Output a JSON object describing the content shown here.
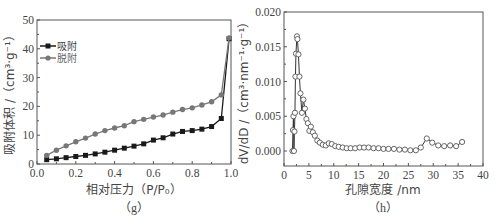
{
  "chart_data": [
    {
      "id": "g",
      "type": "line",
      "caption": "（g）",
      "title": "",
      "xlabel": "相对压力（P/P₀）",
      "ylabel": "吸附体积 /（cm³·g⁻¹）",
      "xlim": [
        0.0,
        1.0
      ],
      "ylim": [
        0,
        50
      ],
      "xticks": [
        "0.0",
        "0.2",
        "0.4",
        "0.6",
        "0.8",
        "1.0"
      ],
      "yticks": [
        "0",
        "10",
        "20",
        "30",
        "40",
        "50"
      ],
      "grid": false,
      "legend_position": "upper-left",
      "x": [
        0.05,
        0.1,
        0.15,
        0.2,
        0.25,
        0.3,
        0.35,
        0.4,
        0.45,
        0.5,
        0.55,
        0.6,
        0.65,
        0.7,
        0.75,
        0.8,
        0.85,
        0.9,
        0.95,
        0.99
      ],
      "series": [
        {
          "name": "吸附",
          "color": "#1a1a1a",
          "marker": "square",
          "values": [
            1.5,
            1.8,
            2.2,
            2.6,
            3.0,
            3.5,
            4.1,
            4.8,
            5.5,
            6.2,
            7.0,
            8.3,
            9.1,
            10.4,
            11.3,
            11.6,
            12.1,
            13.0,
            15.8,
            43.5
          ]
        },
        {
          "name": "脱附",
          "color": "#777777",
          "marker": "circle",
          "values": [
            3.0,
            4.8,
            6.3,
            7.7,
            9.0,
            10.4,
            11.6,
            12.5,
            13.3,
            14.7,
            15.5,
            16.3,
            17.0,
            18.0,
            18.9,
            19.5,
            20.5,
            21.6,
            24.0,
            43.8
          ]
        }
      ]
    },
    {
      "id": "h",
      "type": "line",
      "caption": "（h）",
      "title": "",
      "xlabel": "孔隙宽度 /nm",
      "ylabel": "dV/dD /（cm³·nm⁻¹·g⁻¹）",
      "xlim": [
        0,
        40
      ],
      "ylim": [
        0.0,
        0.02
      ],
      "xticks": [
        "0",
        "5",
        "10",
        "15",
        "20",
        "25",
        "30",
        "35",
        "40"
      ],
      "yticks": [
        "0.000",
        "0.005",
        "0.010",
        "0.015",
        "0.020"
      ],
      "grid": false,
      "series": [
        {
          "name": "dV/dD",
          "color": "#333333",
          "marker": "open-circle",
          "x": [
            1.7,
            1.8,
            1.9,
            2.0,
            2.1,
            2.2,
            2.3,
            2.4,
            2.6,
            2.7,
            2.9,
            3.1,
            3.3,
            3.6,
            3.9,
            4.2,
            4.5,
            4.8,
            5.1,
            5.4,
            5.8,
            6.2,
            6.7,
            7.2,
            7.8,
            8.4,
            9.0,
            9.6,
            10.3,
            11.0,
            11.8,
            12.6,
            13.4,
            14.3,
            15.2,
            16.1,
            17.0,
            18.0,
            19.0,
            20.0,
            21.0,
            22.1,
            23.2,
            24.3,
            25.4,
            26.5,
            27.5,
            28.7,
            29.8,
            31.0,
            32.2,
            33.4,
            34.6,
            35.8
          ],
          "values": [
            0.0,
            0.003,
            0.005,
            0.0,
            0.0028,
            0.0055,
            0.0107,
            0.014,
            0.0165,
            0.0161,
            0.0139,
            0.0107,
            0.0083,
            0.0055,
            0.0074,
            0.0061,
            0.0046,
            0.004,
            0.0029,
            0.0035,
            0.0027,
            0.0022,
            0.0015,
            0.0012,
            0.0009,
            0.0008,
            0.0011,
            0.001,
            0.0007,
            0.0006,
            0.0005,
            0.0004,
            0.0004,
            0.0004,
            0.0005,
            0.0005,
            0.0005,
            0.0004,
            0.0004,
            0.0003,
            0.0003,
            0.0003,
            0.0002,
            0.0002,
            0.0001,
            0.0001,
            0.0005,
            0.0018,
            0.0012,
            0.0008,
            0.0007,
            0.0008,
            0.0007,
            0.0013
          ]
        }
      ]
    }
  ]
}
